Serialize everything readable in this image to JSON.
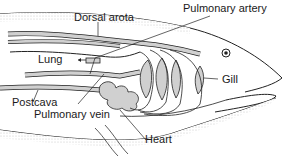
{
  "diagram": {
    "labels": {
      "dorsal_aorta": "Dorsal arota",
      "pulmonary_artery": "Pulmonary artery",
      "lung": "Lung",
      "gill": "Gill",
      "postcava": "Postcava",
      "pulmonary_vein": "Pulmonary vein",
      "heart": "Heart"
    },
    "colors": {
      "outline": "#222222",
      "vessel_fill": "#cfcfcf",
      "body_stipple": "#d8d8d8",
      "background": "#ffffff"
    }
  }
}
